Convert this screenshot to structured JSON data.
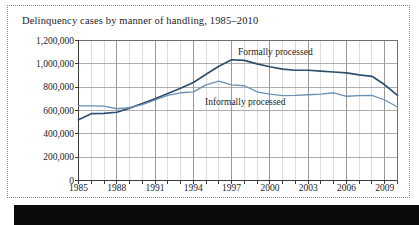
{
  "figure": {
    "title": "Delinquency cases by manner of handling, 1985–2010"
  },
  "chart_data": {
    "type": "line",
    "title": "Delinquency cases by manner of handling, 1985–2010",
    "xlabel": "",
    "ylabel": "",
    "xlim": [
      1985,
      2010
    ],
    "ylim": [
      0,
      1200000
    ],
    "grid": true,
    "legend_position": "inline-annotations",
    "x": [
      1985,
      1986,
      1987,
      1988,
      1989,
      1990,
      1991,
      1992,
      1993,
      1994,
      1995,
      1996,
      1997,
      1998,
      1999,
      2000,
      2001,
      2002,
      2003,
      2004,
      2005,
      2006,
      2007,
      2008,
      2009,
      2010
    ],
    "x_tick_labels": [
      "1985",
      "1988",
      "1991",
      "1994",
      "1997",
      "2000",
      "2003",
      "2006",
      "2009"
    ],
    "x_tick_values": [
      1985,
      1988,
      1991,
      1994,
      1997,
      2000,
      2003,
      2006,
      2009
    ],
    "y_tick_labels": [
      "0",
      "200,000",
      "400,000",
      "600,000",
      "800,000",
      "1,000,000",
      "1,200,000"
    ],
    "y_tick_values": [
      0,
      200000,
      400000,
      600000,
      800000,
      1000000,
      1200000
    ],
    "series": [
      {
        "name": "Formally processed",
        "color": "#2f4f6f",
        "values": [
          520000,
          573000,
          575000,
          585000,
          620000,
          660000,
          700000,
          745000,
          790000,
          840000,
          910000,
          980000,
          1035000,
          1030000,
          1000000,
          975000,
          955000,
          945000,
          945000,
          938000,
          930000,
          922000,
          905000,
          893000,
          820000,
          730000
        ]
      },
      {
        "name": "Informally processed",
        "color": "#6b8fb0",
        "values": [
          640000,
          640000,
          638000,
          615000,
          625000,
          650000,
          690000,
          730000,
          752000,
          760000,
          820000,
          852000,
          820000,
          812000,
          760000,
          740000,
          728000,
          730000,
          735000,
          740000,
          752000,
          722000,
          728000,
          730000,
          690000,
          630000
        ]
      }
    ]
  },
  "annotations": {
    "formally_label": "Formally processed",
    "informally_label": "Informally processed"
  }
}
